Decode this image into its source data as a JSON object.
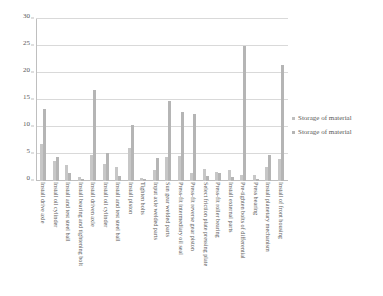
{
  "chart_data": {
    "type": "bar",
    "title": "",
    "subtitle": "",
    "xlabel": "",
    "ylabel": "",
    "ylim": [
      0,
      30
    ],
    "ytick_values": [
      0,
      5,
      10,
      15,
      20,
      25,
      30
    ],
    "ytick_labels": [
      "0",
      "5",
      "10",
      "15",
      "20",
      "25",
      "30"
    ],
    "grid": true,
    "legend_position": "right",
    "orientation": "vertical",
    "xtick_rotation": 90,
    "categories": [
      "Install drive axle",
      "Install oil cylinder",
      "Install and test steel ball",
      "Install bearing and tightening bolt",
      "Install driven axle",
      "Install oil cylinder",
      "Install and test steel ball",
      "Install piston",
      "Tighten bolts",
      "Input axle welded parts",
      "Sun gear welded parts",
      "Press-fit intermediary oil seal",
      "Press-fit reverse gear piston",
      "Select friction plate pressing plate",
      "Press-fit roller bearing",
      "Install external parts",
      "Pre-tighten bolts of differential",
      "Press bearing",
      "Install planetary mechanism",
      "Install of front housing"
    ],
    "series": [
      {
        "name": "Storage of material",
        "color": "#c7c7c7",
        "values": [
          6.8,
          3.7,
          2.9,
          0.8,
          4.8,
          3.2,
          2.6,
          6.2,
          0.6,
          2.0,
          4.5,
          4.7,
          1.5,
          2.2,
          1.6,
          2.0,
          1.2,
          1.1,
          2.6,
          4.0
        ]
      },
      {
        "name": "Storage of material",
        "color": "#b5b5b5",
        "values": [
          13.4,
          4.4,
          1.4,
          0.4,
          16.9,
          5.2,
          1.0,
          10.3,
          0.3,
          4.2,
          14.8,
          12.7,
          12.5,
          0.9,
          1.5,
          0.8,
          25.0,
          0.4,
          4.8,
          21.5
        ]
      }
    ]
  },
  "legend": {
    "entries": [
      {
        "label": "Storage of material"
      },
      {
        "label": "Storage of material"
      }
    ]
  }
}
